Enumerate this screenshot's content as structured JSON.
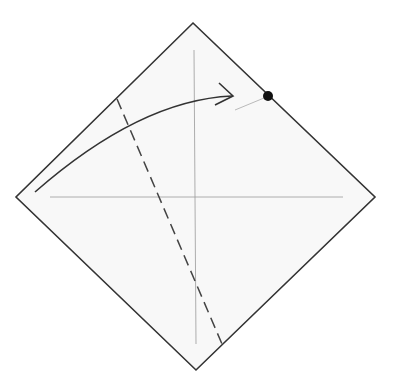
{
  "diagram": {
    "type": "origami-fold-step",
    "colors": {
      "background": "#ffffff",
      "paper_fill": "#f8f8f8",
      "paper_edge": "#333333",
      "crease": "#999999",
      "valley_fold": "#444444",
      "arrow": "#333333",
      "reference_dot": "#111111",
      "guide_line": "#aaaaaa"
    },
    "paper": {
      "shape": "square-rotated-45",
      "vertices": [
        [
          193,
          23
        ],
        [
          375,
          197
        ],
        [
          196,
          370
        ],
        [
          16,
          197
        ]
      ]
    },
    "creases": [
      {
        "name": "vertical-center-crease",
        "from": [
          194,
          50
        ],
        "to": [
          196,
          344
        ]
      },
      {
        "name": "horizontal-center-crease",
        "from": [
          50,
          197
        ],
        "to": [
          343,
          197
        ]
      }
    ],
    "valley_fold_line": {
      "from": [
        117,
        99
      ],
      "to": [
        222,
        344
      ],
      "dash": "11 6"
    },
    "fold_arrow": {
      "start": [
        35,
        192
      ],
      "control": [
        140,
        100
      ],
      "end": [
        232,
        96
      ],
      "head_upper": [
        219,
        83
      ],
      "head_lower": [
        215,
        105
      ]
    },
    "reference_dot": {
      "center": [
        268,
        96
      ],
      "radius": 5
    },
    "guide_line": {
      "from": [
        235,
        110
      ],
      "to": [
        264,
        98
      ]
    }
  }
}
